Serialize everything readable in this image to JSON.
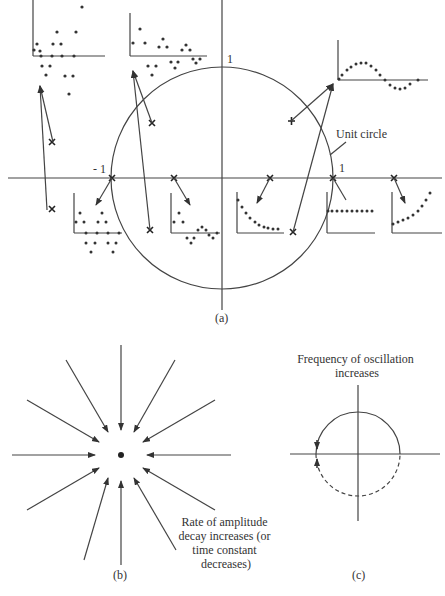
{
  "panel_a": {
    "caption": "(a)",
    "unit_circle_label": "Unit circle",
    "tick_one_top": "1",
    "tick_minus_one": "- 1",
    "tick_one_right": "1"
  },
  "panel_b": {
    "caption": "(b)",
    "annotation_lines": [
      "Rate of amplitude",
      "decay increases (or",
      "time constant",
      "decreases)"
    ]
  },
  "panel_c": {
    "caption": "(c)",
    "title_lines": [
      "Frequency of oscillation",
      "increases"
    ]
  },
  "colors": {
    "ink": "#333333",
    "background": "#ffffff"
  }
}
